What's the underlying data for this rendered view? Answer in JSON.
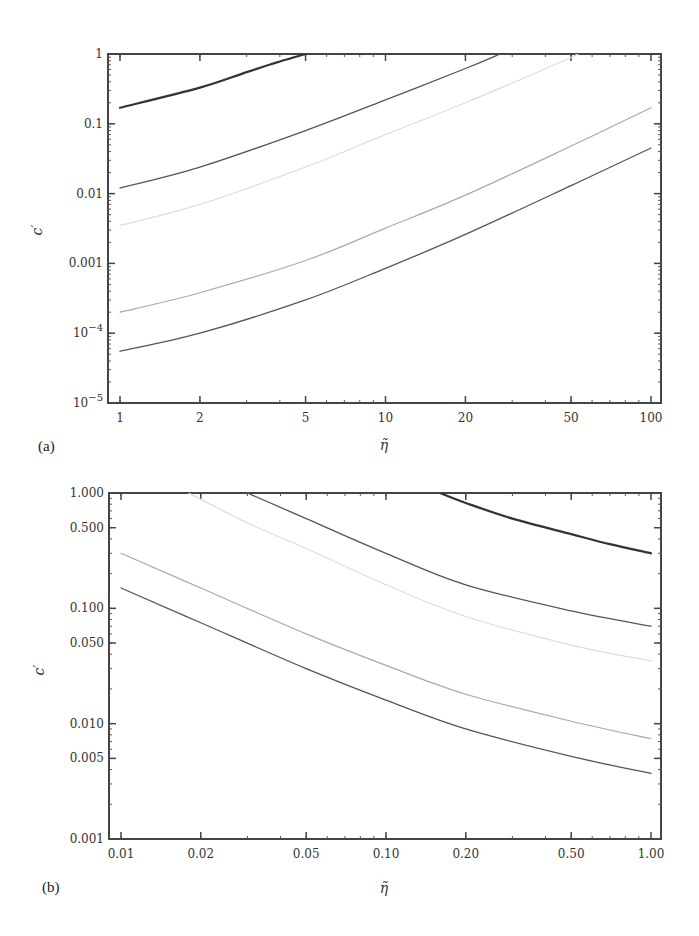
{
  "chart_data": [
    {
      "panel": "(a)",
      "type": "line",
      "xscale": "log",
      "yscale": "log",
      "xlabel": "η̃",
      "ylabel": "c′",
      "xlim": [
        1,
        100
      ],
      "ylim": [
        1e-05,
        1
      ],
      "xticks": [
        {
          "value": 1,
          "label": "1"
        },
        {
          "value": 2,
          "label": "2"
        },
        {
          "value": 5,
          "label": "5"
        },
        {
          "value": 10,
          "label": "10"
        },
        {
          "value": 20,
          "label": "20"
        },
        {
          "value": 50,
          "label": "50"
        },
        {
          "value": 100,
          "label": "100"
        }
      ],
      "yticks": [
        {
          "value": 1,
          "label": "1"
        },
        {
          "value": 0.1,
          "label": "0.1"
        },
        {
          "value": 0.01,
          "label": "0.01"
        },
        {
          "value": 0.001,
          "label": "0.001"
        },
        {
          "value": 0.0001,
          "label": "10",
          "sup": "−4"
        },
        {
          "value": 1e-05,
          "label": "10",
          "sup": "−5"
        }
      ],
      "series": [
        {
          "name": "curve-1",
          "color": "#333333",
          "width": 2.2,
          "x": [
            1,
            2,
            3,
            4,
            5
          ],
          "y": [
            0.17,
            0.33,
            0.55,
            0.78,
            1.0
          ]
        },
        {
          "name": "curve-2",
          "color": "#555555",
          "width": 1.3,
          "x": [
            1,
            2,
            5,
            10,
            20,
            27
          ],
          "y": [
            0.012,
            0.024,
            0.08,
            0.22,
            0.62,
            1.0
          ]
        },
        {
          "name": "curve-3",
          "color": "#dddddd",
          "width": 1.2,
          "x": [
            1,
            2,
            5,
            10,
            20,
            50,
            100
          ],
          "y": [
            0.0035,
            0.007,
            0.024,
            0.07,
            0.2,
            0.9,
            3.3
          ]
        },
        {
          "name": "curve-4",
          "color": "#aaaaaa",
          "width": 1.2,
          "x": [
            1,
            2,
            5,
            10,
            20,
            50,
            100
          ],
          "y": [
            0.0002,
            0.00038,
            0.0011,
            0.0032,
            0.0095,
            0.048,
            0.17
          ]
        },
        {
          "name": "curve-5",
          "color": "#555555",
          "width": 1.3,
          "x": [
            1,
            2,
            5,
            10,
            20,
            50,
            100
          ],
          "y": [
            5.5e-05,
            0.0001,
            0.0003,
            0.00085,
            0.0026,
            0.013,
            0.045
          ]
        }
      ]
    },
    {
      "panel": "(b)",
      "type": "line",
      "xscale": "log",
      "yscale": "log",
      "xlabel": "η̃",
      "ylabel": "c′",
      "xlim": [
        0.01,
        1.0
      ],
      "ylim": [
        0.001,
        1.0
      ],
      "xticks": [
        {
          "value": 0.01,
          "label": "0.01"
        },
        {
          "value": 0.02,
          "label": "0.02"
        },
        {
          "value": 0.05,
          "label": "0.05"
        },
        {
          "value": 0.1,
          "label": "0.10"
        },
        {
          "value": 0.2,
          "label": "0.20"
        },
        {
          "value": 0.5,
          "label": "0.50"
        },
        {
          "value": 1.0,
          "label": "1.00"
        }
      ],
      "yticks": [
        {
          "value": 1.0,
          "label": "1.000"
        },
        {
          "value": 0.5,
          "label": "0.500"
        },
        {
          "value": 0.1,
          "label": "0.100"
        },
        {
          "value": 0.05,
          "label": "0.050"
        },
        {
          "value": 0.01,
          "label": "0.010"
        },
        {
          "value": 0.005,
          "label": "0.005"
        },
        {
          "value": 0.001,
          "label": "0.001"
        }
      ],
      "series": [
        {
          "name": "curve-1",
          "color": "#333333",
          "width": 2.2,
          "x": [
            0.16,
            0.2,
            0.3,
            0.5,
            0.7,
            1.0
          ],
          "y": [
            1.0,
            0.82,
            0.6,
            0.44,
            0.36,
            0.3
          ]
        },
        {
          "name": "curve-2",
          "color": "#555555",
          "width": 1.3,
          "x": [
            0.03,
            0.05,
            0.1,
            0.2,
            0.5,
            1.0
          ],
          "y": [
            1.0,
            0.6,
            0.3,
            0.16,
            0.095,
            0.07
          ]
        },
        {
          "name": "curve-3",
          "color": "#dddddd",
          "width": 1.2,
          "x": [
            0.018,
            0.03,
            0.05,
            0.1,
            0.2,
            0.5,
            1.0
          ],
          "y": [
            1.0,
            0.55,
            0.33,
            0.16,
            0.085,
            0.048,
            0.035
          ]
        },
        {
          "name": "curve-4",
          "color": "#aaaaaa",
          "width": 1.2,
          "x": [
            0.01,
            0.02,
            0.05,
            0.1,
            0.2,
            0.5,
            1.0
          ],
          "y": [
            0.3,
            0.15,
            0.06,
            0.032,
            0.018,
            0.0105,
            0.0074
          ]
        },
        {
          "name": "curve-5",
          "color": "#555555",
          "width": 1.3,
          "x": [
            0.01,
            0.02,
            0.05,
            0.1,
            0.2,
            0.5,
            1.0
          ],
          "y": [
            0.15,
            0.075,
            0.03,
            0.016,
            0.009,
            0.0052,
            0.0037
          ]
        }
      ]
    }
  ]
}
